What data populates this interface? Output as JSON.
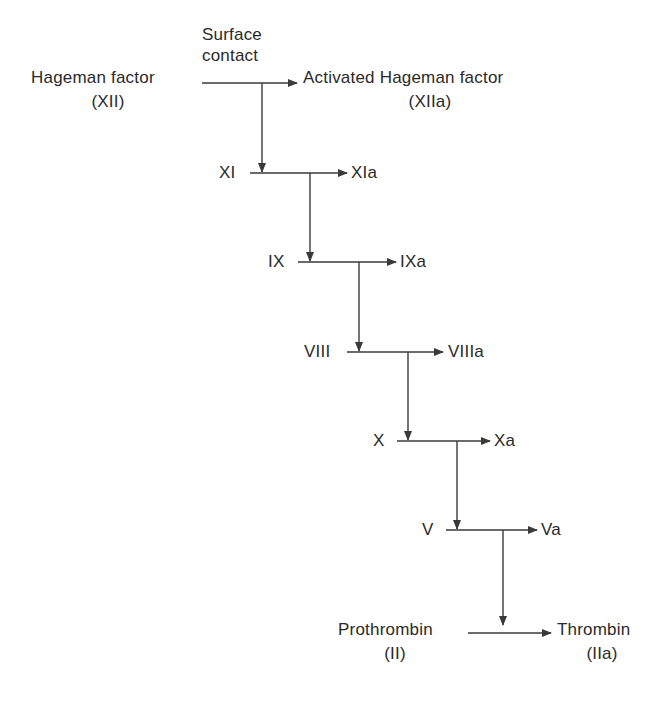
{
  "diagram": {
    "trigger_label_line1": "Surface",
    "trigger_label_line2": "contact",
    "colors": {
      "line": "#3a3a3a",
      "text": "#2a2a2a",
      "background": "#ffffff"
    },
    "steps": [
      {
        "from": "Hageman factor",
        "from_sub": "(XII)",
        "to": "Activated Hageman factor",
        "to_sub": "(XIIa)"
      },
      {
        "from": "XI",
        "to": "XIa"
      },
      {
        "from": "IX",
        "to": "IXa"
      },
      {
        "from": "VIII",
        "to": "VIIIa"
      },
      {
        "from": "X",
        "to": "Xa"
      },
      {
        "from": "V",
        "to": "Va"
      },
      {
        "from": "Prothrombin",
        "from_sub": "(II)",
        "to": "Thrombin",
        "to_sub": "(IIa)"
      }
    ]
  }
}
